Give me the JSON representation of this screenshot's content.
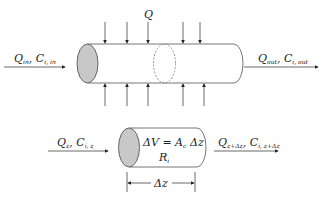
{
  "diagram": {
    "type": "plug-flow reactor schematic",
    "colors": {
      "stroke": "#444444",
      "ellipse_fill": "#c8c8c8",
      "background": "#ffffff"
    },
    "top": {
      "side_flow_label": "Q",
      "inlet": {
        "q": "Q",
        "q_sub": "in",
        "c": "C",
        "c_sub": "i, in"
      },
      "outlet": {
        "q": "Q",
        "q_sub": "out",
        "c": "C",
        "c_sub": "i, out"
      },
      "top_arrows_x": [
        105,
        127,
        148,
        183,
        200
      ],
      "bottom_arrows_x": [
        105,
        127,
        148,
        183,
        204
      ]
    },
    "bottom": {
      "inlet": {
        "q": "Q",
        "q_sub": "z",
        "c": "C",
        "c_sub": "i, z"
      },
      "outlet": {
        "q": "Q",
        "q_sub": "z+Δz",
        "c": "C",
        "c_sub": "i, z+Δz"
      },
      "volume_eq": {
        "lhs": "ΔV",
        "eq": " = ",
        "a": "A",
        "a_sub": "c",
        "dz": "Δz"
      },
      "rate": {
        "r": "R",
        "r_sub": "i"
      },
      "dimension_label": "Δz"
    }
  }
}
